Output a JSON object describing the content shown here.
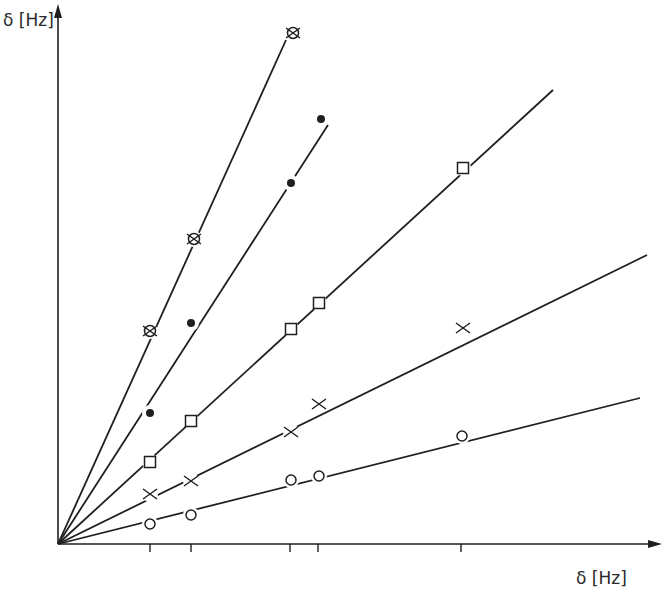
{
  "chart_data": {
    "type": "scatter",
    "title": "",
    "xlabel": "δ [Hz]",
    "ylabel": "δ [Hz]",
    "grid": false,
    "legend": null,
    "x_ticks_px": [
      150,
      191,
      290,
      318,
      461
    ],
    "axes_px": {
      "origin": [
        58,
        544
      ],
      "x_end": [
        657,
        544
      ],
      "y_end": [
        58,
        6
      ]
    },
    "series": [
      {
        "name": "crossed-circle",
        "marker": "crossed-circle",
        "points_px": [
          [
            150,
            331
          ],
          [
            194,
            239
          ],
          [
            293,
            33
          ]
        ],
        "fit_line_px": [
          [
            58,
            544
          ],
          [
            286,
            40
          ]
        ]
      },
      {
        "name": "filled-dot",
        "marker": "filled-circle",
        "points_px": [
          [
            150,
            413
          ],
          [
            191,
            323
          ],
          [
            291,
            183
          ],
          [
            321,
            119
          ]
        ],
        "fit_line_px": [
          [
            58,
            544
          ],
          [
            328,
            125
          ]
        ]
      },
      {
        "name": "square",
        "marker": "square",
        "points_px": [
          [
            150,
            462
          ],
          [
            191,
            421
          ],
          [
            291,
            329
          ],
          [
            319,
            303
          ],
          [
            463,
            168
          ]
        ],
        "fit_line_px": [
          [
            58,
            544
          ],
          [
            553,
            90
          ]
        ]
      },
      {
        "name": "cross",
        "marker": "x",
        "points_px": [
          [
            150,
            494
          ],
          [
            191,
            481
          ],
          [
            291,
            432
          ],
          [
            319,
            404
          ],
          [
            463,
            328
          ]
        ],
        "fit_line_px": [
          [
            58,
            544
          ],
          [
            647,
            255
          ]
        ]
      },
      {
        "name": "open-circle",
        "marker": "open-circle",
        "points_px": [
          [
            150,
            524
          ],
          [
            191,
            515
          ],
          [
            291,
            480
          ],
          [
            319,
            476
          ],
          [
            462,
            436
          ]
        ],
        "fit_line_px": [
          [
            58,
            544
          ],
          [
            640,
            398
          ]
        ]
      }
    ]
  },
  "colors": {
    "ink": "#1f1f1f",
    "background": "#ffffff"
  }
}
